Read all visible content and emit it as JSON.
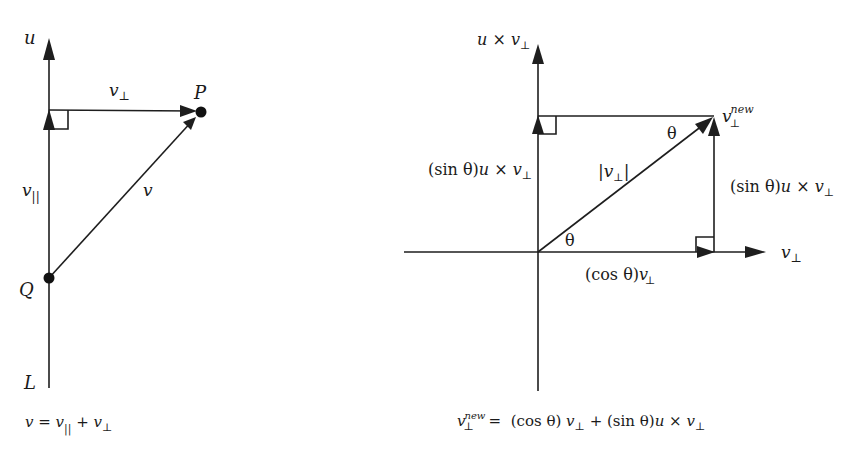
{
  "left_diagram": {
    "axis_label_top": "u",
    "axis_label_bottom": "L",
    "point_P": "P",
    "point_Q": "Q",
    "vec_perp": "v",
    "vec_perp_sub": "⊥",
    "vec_par": "v",
    "vec_par_sub": "||",
    "vec_v": "v",
    "formula": {
      "lhs": "v",
      "eq": " = ",
      "t1": "v",
      "t1_sub": "||",
      "plus": " + ",
      "t2": "v",
      "t2_sub": "⊥"
    }
  },
  "right_diagram": {
    "axis_top_label": {
      "u": "u",
      "times": " × ",
      "v": "v",
      "sub": "⊥"
    },
    "axis_right_label": {
      "v": "v",
      "sub": "⊥"
    },
    "left_side_label": {
      "pre": "(sin θ)",
      "u": "u",
      "times": " × ",
      "v": "v",
      "sub": "⊥"
    },
    "right_side_label": {
      "pre": "(sin θ)",
      "u": "u",
      "times": " × ",
      "v": "v",
      "sub": "⊥"
    },
    "bottom_label": {
      "pre": "(cos θ)",
      "v": "v",
      "sub": "⊥"
    },
    "magnitude_label": {
      "bar_l": "|",
      "v": "v",
      "sub": "⊥",
      "bar_r": "|"
    },
    "angle_bottom": "θ",
    "angle_top": "θ",
    "vnew_label": {
      "v": "v",
      "sup": "new",
      "sub": "⊥"
    },
    "formula": {
      "lhs_v": "v",
      "lhs_sup": "new",
      "lhs_sub": "⊥",
      "eq": " =  ",
      "cos": "(cos θ) ",
      "v1": "v",
      "v1_sub": "⊥",
      "plus": " + ",
      "sin": "(sin θ)",
      "u": "u",
      "times": " × ",
      "v2": "v",
      "v2_sub": "⊥"
    }
  }
}
